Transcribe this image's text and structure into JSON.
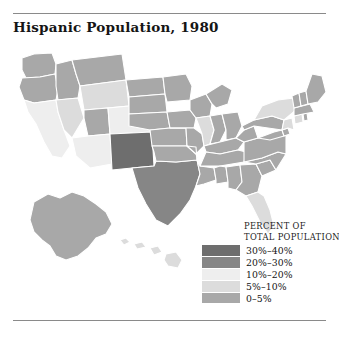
{
  "figure": {
    "title": "Hispanic Population, 1980"
  },
  "legend": {
    "heading_line1": "PERCENT OF",
    "heading_line2": "TOTAL POPULATION",
    "classes": [
      {
        "label": "30%–40%",
        "color": "#6e6e6e",
        "min": 30,
        "max": 40
      },
      {
        "label": "20%–30%",
        "color": "#868686",
        "min": 20,
        "max": 30
      },
      {
        "label": "10%–20%",
        "color": "#eeeeee",
        "min": 10,
        "max": 20
      },
      {
        "label": "5%–10%",
        "color": "#dcdcdc",
        "min": 5,
        "max": 10
      },
      {
        "label": "0–5%",
        "color": "#a8a8a8",
        "min": 0,
        "max": 5
      }
    ]
  },
  "chart_data": {
    "type": "choropleth",
    "title": "Hispanic Population, 1980",
    "unit": "percent of total population",
    "legend_title": "PERCENT OF TOTAL POPULATION",
    "states": [
      {
        "name": "Washington",
        "class": "0–5%",
        "color": "#a8a8a8"
      },
      {
        "name": "Oregon",
        "class": "0–5%",
        "color": "#a8a8a8"
      },
      {
        "name": "Idaho",
        "class": "0–5%",
        "color": "#a8a8a8"
      },
      {
        "name": "Montana",
        "class": "0–5%",
        "color": "#a8a8a8"
      },
      {
        "name": "Wyoming",
        "class": "5%–10%",
        "color": "#dcdcdc"
      },
      {
        "name": "California",
        "class": "10%–20%",
        "color": "#eeeeee"
      },
      {
        "name": "Nevada",
        "class": "5%–10%",
        "color": "#dcdcdc"
      },
      {
        "name": "Utah",
        "class": "0–5%",
        "color": "#a8a8a8"
      },
      {
        "name": "Arizona",
        "class": "10%–20%",
        "color": "#eeeeee"
      },
      {
        "name": "Colorado",
        "class": "10%–20%",
        "color": "#eeeeee"
      },
      {
        "name": "New Mexico",
        "class": "30%–40%",
        "color": "#6e6e6e"
      },
      {
        "name": "Texas",
        "class": "20%–30%",
        "color": "#868686"
      },
      {
        "name": "North Dakota",
        "class": "0–5%",
        "color": "#a8a8a8"
      },
      {
        "name": "South Dakota",
        "class": "0–5%",
        "color": "#a8a8a8"
      },
      {
        "name": "Nebraska",
        "class": "0–5%",
        "color": "#a8a8a8"
      },
      {
        "name": "Kansas",
        "class": "0–5%",
        "color": "#a8a8a8"
      },
      {
        "name": "Oklahoma",
        "class": "0–5%",
        "color": "#a8a8a8"
      },
      {
        "name": "Minnesota",
        "class": "0–5%",
        "color": "#a8a8a8"
      },
      {
        "name": "Iowa",
        "class": "0–5%",
        "color": "#a8a8a8"
      },
      {
        "name": "Missouri",
        "class": "0–5%",
        "color": "#a8a8a8"
      },
      {
        "name": "Arkansas",
        "class": "0–5%",
        "color": "#a8a8a8"
      },
      {
        "name": "Louisiana",
        "class": "0–5%",
        "color": "#a8a8a8"
      },
      {
        "name": "Wisconsin",
        "class": "0–5%",
        "color": "#a8a8a8"
      },
      {
        "name": "Illinois",
        "class": "5%–10%",
        "color": "#dcdcdc"
      },
      {
        "name": "Michigan",
        "class": "0–5%",
        "color": "#a8a8a8"
      },
      {
        "name": "Indiana",
        "class": "0–5%",
        "color": "#a8a8a8"
      },
      {
        "name": "Ohio",
        "class": "0–5%",
        "color": "#a8a8a8"
      },
      {
        "name": "Kentucky",
        "class": "0–5%",
        "color": "#a8a8a8"
      },
      {
        "name": "Tennessee",
        "class": "0–5%",
        "color": "#a8a8a8"
      },
      {
        "name": "Mississippi",
        "class": "0–5%",
        "color": "#a8a8a8"
      },
      {
        "name": "Alabama",
        "class": "0–5%",
        "color": "#a8a8a8"
      },
      {
        "name": "Georgia",
        "class": "0–5%",
        "color": "#a8a8a8"
      },
      {
        "name": "Florida",
        "class": "5%–10%",
        "color": "#dcdcdc"
      },
      {
        "name": "South Carolina",
        "class": "0–5%",
        "color": "#a8a8a8"
      },
      {
        "name": "North Carolina",
        "class": "0–5%",
        "color": "#a8a8a8"
      },
      {
        "name": "Virginia",
        "class": "0–5%",
        "color": "#a8a8a8"
      },
      {
        "name": "West Virginia",
        "class": "0–5%",
        "color": "#a8a8a8"
      },
      {
        "name": "Maryland",
        "class": "0–5%",
        "color": "#a8a8a8"
      },
      {
        "name": "Delaware",
        "class": "0–5%",
        "color": "#a8a8a8"
      },
      {
        "name": "Pennsylvania",
        "class": "0–5%",
        "color": "#a8a8a8"
      },
      {
        "name": "New Jersey",
        "class": "5%–10%",
        "color": "#dcdcdc"
      },
      {
        "name": "New York",
        "class": "5%–10%",
        "color": "#dcdcdc"
      },
      {
        "name": "Connecticut",
        "class": "5%–10%",
        "color": "#dcdcdc"
      },
      {
        "name": "Rhode Island",
        "class": "0–5%",
        "color": "#a8a8a8"
      },
      {
        "name": "Massachusetts",
        "class": "0–5%",
        "color": "#a8a8a8"
      },
      {
        "name": "Vermont",
        "class": "0–5%",
        "color": "#a8a8a8"
      },
      {
        "name": "New Hampshire",
        "class": "0–5%",
        "color": "#a8a8a8"
      },
      {
        "name": "Maine",
        "class": "0–5%",
        "color": "#a8a8a8"
      },
      {
        "name": "Alaska",
        "class": "0–5%",
        "color": "#a8a8a8"
      },
      {
        "name": "Hawaii",
        "class": "5%–10%",
        "color": "#dcdcdc"
      }
    ]
  }
}
